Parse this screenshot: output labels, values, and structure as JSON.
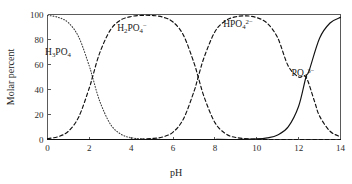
{
  "chart_data": {
    "type": "line",
    "title": "",
    "xlabel": "pH",
    "ylabel": "Molar percent",
    "xlim": [
      0,
      14
    ],
    "ylim": [
      0,
      100
    ],
    "xticks": [
      0,
      2,
      4,
      6,
      8,
      10,
      12,
      14
    ],
    "yticks": [
      0,
      20,
      40,
      60,
      80,
      100
    ],
    "grid": false,
    "legend_position": "inline-annotations",
    "pka_values": [
      2.15,
      7.2,
      12.35
    ],
    "series": [
      {
        "name": "H3PO4",
        "label_text": "H",
        "label_sub1": "3",
        "label_mid": "PO",
        "label_sub2": "4",
        "label_sup": "",
        "style": "dotted",
        "x": [
          0,
          0.5,
          1,
          1.5,
          2,
          2.15,
          2.5,
          3,
          3.5,
          4,
          4.5,
          5,
          6,
          7,
          8,
          10,
          12,
          14
        ],
        "values": [
          99.3,
          97.8,
          93.4,
          81.7,
          58.6,
          50.0,
          30.5,
          12.4,
          4.3,
          1.4,
          0.45,
          0.14,
          0.014,
          0.0014,
          0.0001,
          0,
          0,
          0
        ]
      },
      {
        "name": "H2PO4-",
        "label_text": "H",
        "label_sub1": "2",
        "label_mid": "PO",
        "label_sub2": "4",
        "label_sup": "−",
        "style": "dashed",
        "x": [
          0,
          0.5,
          1,
          1.5,
          2,
          2.15,
          2.5,
          3,
          3.5,
          4,
          4.5,
          5,
          5.5,
          6,
          6.5,
          7,
          7.2,
          7.5,
          8,
          8.5,
          9,
          10,
          11,
          12,
          13,
          14
        ],
        "values": [
          0.7,
          2.2,
          6.6,
          18.3,
          41.4,
          50.0,
          69.5,
          87.5,
          95.6,
          98.4,
          99.3,
          99.2,
          98.0,
          94.0,
          83.3,
          61.3,
          50.0,
          33.3,
          13.5,
          4.8,
          1.6,
          0.16,
          0.016,
          0.0015,
          0.0001,
          0
        ]
      },
      {
        "name": "HPO4 2-",
        "label_text": "HPO",
        "label_sub1": "",
        "label_mid": "",
        "label_sub2": "4",
        "label_sup": "2−",
        "style": "dashed",
        "x": [
          0,
          2,
          4,
          5,
          5.5,
          6,
          6.5,
          7,
          7.2,
          7.5,
          8,
          8.5,
          9,
          9.5,
          10,
          10.5,
          11,
          11.5,
          12,
          12.35,
          12.75,
          13,
          13.5,
          14
        ],
        "values": [
          0,
          0,
          0.06,
          0.79,
          1.97,
          5.9,
          16.6,
          38.5,
          50.0,
          66.5,
          86.2,
          95.0,
          98.2,
          98.9,
          97.5,
          93.0,
          81.3,
          58.9,
          50.0,
          50.0,
          30.9,
          18.7,
          6.6,
          2.2
        ]
      },
      {
        "name": "PO4 3-",
        "label_text": "PO",
        "label_sub1": "",
        "label_mid": "",
        "label_sub2": "4",
        "label_sup": "3−",
        "style": "solid",
        "x": [
          0,
          4,
          8,
          9,
          10,
          10.5,
          11,
          11.5,
          12,
          12.35,
          12.5,
          13,
          13.5,
          14
        ],
        "values": [
          0,
          0,
          0.04,
          0.04,
          0.45,
          1.3,
          3.6,
          10.1,
          26.6,
          50.0,
          55.0,
          81.0,
          93.2,
          97.7
        ]
      }
    ]
  },
  "axes": {
    "y_label": "Molar percent",
    "x_label": "pH",
    "y_tick_labels": [
      "0",
      "20",
      "40",
      "60",
      "80",
      "100"
    ],
    "x_tick_labels": [
      "0",
      "2",
      "4",
      "6",
      "8",
      "10",
      "12",
      "14"
    ]
  },
  "colors": {
    "background": "#ffffff",
    "axis": "#5a5a5a",
    "curve": "#111111",
    "text": "#1a1a1a"
  }
}
